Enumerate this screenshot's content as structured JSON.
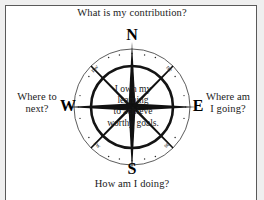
{
  "page": {
    "background": "#efefef",
    "sheet_background": "#ffffff",
    "border_color": "#5a5a5a",
    "text_color": "#1b1b1b"
  },
  "diagram": {
    "type": "compass-rose",
    "center_text": "I own my\nlearning\nto achieve\nworthy goals.",
    "cardinals": {
      "north": "N",
      "east": "E",
      "south": "S",
      "west": "W"
    },
    "intercardinals": {
      "northwest": "nw",
      "northeast": "ne",
      "southeast": "se",
      "southwest": "sw"
    },
    "questions": {
      "north": "What is my contribution?",
      "east": "Where am\nI going?",
      "south": "How am I doing?",
      "west": "Where to\nnext?"
    },
    "geometry": {
      "center_x": 132,
      "center_y": 107,
      "outer_radius": 58,
      "inner_radius": 41,
      "needle_color": "#111111",
      "ring_color": "#3a3a3a"
    }
  }
}
